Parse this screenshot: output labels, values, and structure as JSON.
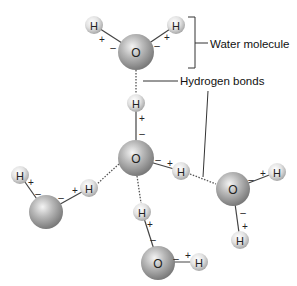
{
  "diagram": {
    "labels": {
      "water_molecule": "Water molecule",
      "hydrogen_bonds": "Hydrogen bonds"
    },
    "atom_symbols": {
      "oxygen": "O",
      "hydrogen": "H"
    },
    "charges": {
      "positive": "+",
      "negative": "–"
    },
    "molecules": [
      {
        "id": "top",
        "oxygen_labeled": true
      },
      {
        "id": "center",
        "oxygen_labeled": true
      },
      {
        "id": "right",
        "oxygen_labeled": true
      },
      {
        "id": "left",
        "oxygen_labeled": false
      },
      {
        "id": "bottom",
        "oxygen_labeled": true
      }
    ],
    "colors": {
      "oxygen": "#a8a8a8",
      "hydrogen": "#d8d8d8",
      "bond": "#444444",
      "hbond": "#666666"
    }
  }
}
